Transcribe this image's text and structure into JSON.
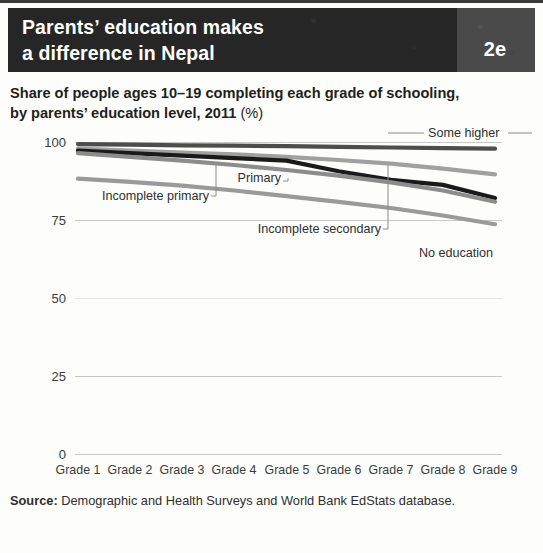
{
  "header": {
    "title_line1": "Parents’ education makes",
    "title_line2": "a difference in Nepal",
    "badge": "2e",
    "bg_color": "#262626",
    "badge_bg_color": "#4a4a4a",
    "text_color": "#ffffff"
  },
  "subtitle": {
    "line1": "Share of people ages 10–19 completing each grade of schooling,",
    "line2": "by parents’ education level, 2011",
    "unit": "(%)"
  },
  "source": {
    "label": "Source:",
    "text": " Demographic and Health Surveys and World Bank EdStats database."
  },
  "chart_data": {
    "type": "line",
    "title": "Share of people ages 10–19 completing each grade of schooling, by parents’ education level, 2011 (%)",
    "xlabel": "",
    "ylabel": "",
    "ylim": [
      0,
      100
    ],
    "yticks": [
      "0",
      "25",
      "50",
      "75",
      "100"
    ],
    "ytick_values": [
      0,
      25,
      50,
      75,
      100
    ],
    "grid": "horizontal",
    "legend_position": "inline-annotations",
    "categories": [
      "Grade 1",
      "Grade 2",
      "Grade 3",
      "Grade 4",
      "Grade 5",
      "Grade 6",
      "Grade 7",
      "Grade 8",
      "Grade 9"
    ],
    "series": [
      {
        "name": "Some higher",
        "color": "#4d4d4d",
        "values": [
          99.5,
          99.3,
          99.1,
          99.0,
          98.8,
          98.6,
          98.4,
          98.2,
          98.0
        ]
      },
      {
        "name": "Incomplete secondary",
        "color": "#a0a0a0",
        "values": [
          98.0,
          97.4,
          96.8,
          96.2,
          95.4,
          94.4,
          93.2,
          91.6,
          89.8
        ]
      },
      {
        "name": "Primary",
        "color": "#1a1a1a",
        "values": [
          97.4,
          96.6,
          95.8,
          95.0,
          94.2,
          90.8,
          88.0,
          86.4,
          82.2
        ]
      },
      {
        "name": "Incomplete primary",
        "color": "#8c8c8c",
        "values": [
          96.6,
          95.4,
          94.2,
          92.8,
          91.2,
          89.4,
          87.2,
          84.6,
          81.0
        ]
      },
      {
        "name": "No education",
        "color": "#9a9a9a",
        "values": [
          88.4,
          87.4,
          86.2,
          84.6,
          82.8,
          81.0,
          79.0,
          76.6,
          73.8
        ]
      }
    ],
    "annotations": [
      {
        "text": "Some higher",
        "series": "Some higher"
      },
      {
        "text": "Primary",
        "series": "Primary"
      },
      {
        "text": "Incomplete primary",
        "series": "Incomplete primary"
      },
      {
        "text": "Incomplete secondary",
        "series": "Incomplete secondary"
      },
      {
        "text": "No education",
        "series": "No education"
      }
    ]
  }
}
